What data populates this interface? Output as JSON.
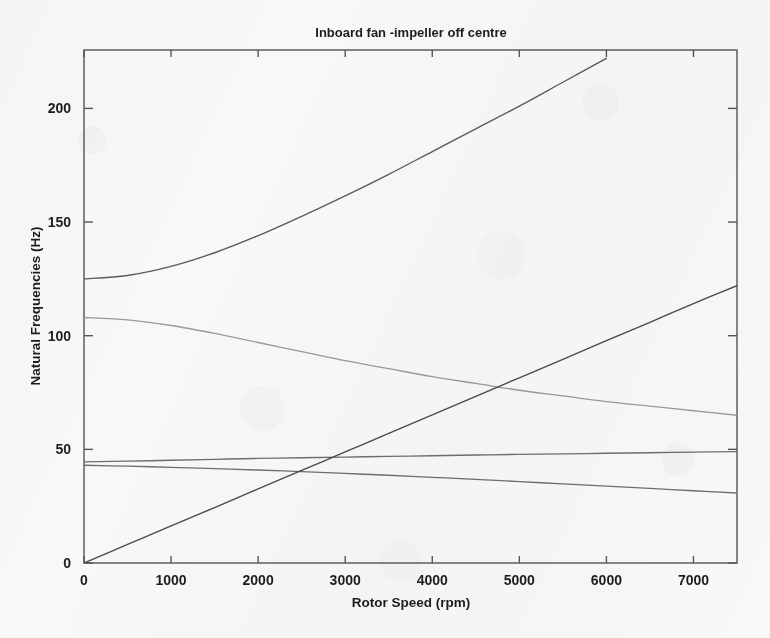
{
  "chart_data": {
    "type": "line",
    "title": "Inboard fan -impeller off centre",
    "xlabel": "Rotor Speed (rpm)",
    "ylabel": "Natural Frequencies (Hz)",
    "xlim": [
      0,
      7500
    ],
    "ylim": [
      0,
      225.7
    ],
    "xticks": [
      0,
      1000,
      2000,
      3000,
      4000,
      5000,
      6000,
      7000
    ],
    "xticklabels": [
      "0",
      "1000",
      "2000",
      "3000",
      "4000",
      "5000",
      "6000",
      "7000"
    ],
    "yticks": [
      0,
      50,
      100,
      150,
      200
    ],
    "yticklabels": [
      "0",
      "50",
      "100",
      "150",
      "200"
    ],
    "grid": false,
    "legend": "none",
    "box": true,
    "x": [
      0,
      500,
      1000,
      1500,
      2000,
      2500,
      3000,
      3500,
      4000,
      4500,
      5000,
      5500,
      6000,
      6500,
      7000,
      7500
    ],
    "series": [
      {
        "name": "mode-1-forward-whirl",
        "color": "#5a5a5a",
        "values": [
          125.0,
          126.5,
          130.5,
          136.5,
          144.0,
          152.5,
          161.5,
          171.0,
          181.0,
          191.0,
          201.0,
          211.5,
          222.0,
          null,
          null,
          null
        ],
        "clipped_at_top": true,
        "exits_axes_at_x": 6020
      },
      {
        "name": "mode-2-backward-whirl",
        "color": "#9a9a9a",
        "values": [
          108.0,
          107.0,
          104.5,
          101.0,
          97.0,
          93.0,
          89.0,
          85.5,
          82.0,
          79.0,
          76.0,
          73.5,
          71.0,
          69.0,
          67.0,
          65.0
        ]
      },
      {
        "name": "mode-3-near-constant-forward",
        "color": "#6e6e6e",
        "values": [
          44.5,
          44.8,
          45.2,
          45.6,
          46.0,
          46.3,
          46.6,
          46.9,
          47.2,
          47.5,
          47.8,
          48.0,
          48.3,
          48.5,
          48.8,
          49.0
        ]
      },
      {
        "name": "mode-4-near-constant-backward",
        "color": "#6e6e6e",
        "values": [
          43.0,
          42.6,
          42.1,
          41.5,
          40.9,
          40.2,
          39.4,
          38.6,
          37.7,
          36.8,
          35.8,
          34.8,
          33.8,
          32.8,
          31.8,
          30.8
        ]
      },
      {
        "name": "synchronous-1x-line",
        "color": "#4a4a4a",
        "values": [
          0.0,
          8.15,
          16.3,
          24.4,
          32.6,
          40.7,
          48.9,
          57.0,
          65.2,
          73.3,
          81.5,
          89.6,
          97.8,
          105.9,
          114.1,
          122.0
        ]
      }
    ],
    "annotations": []
  },
  "figure": {
    "background_color": "#f8f8f8",
    "axes_color": "#555555",
    "text_color": "#1d1d1d"
  }
}
